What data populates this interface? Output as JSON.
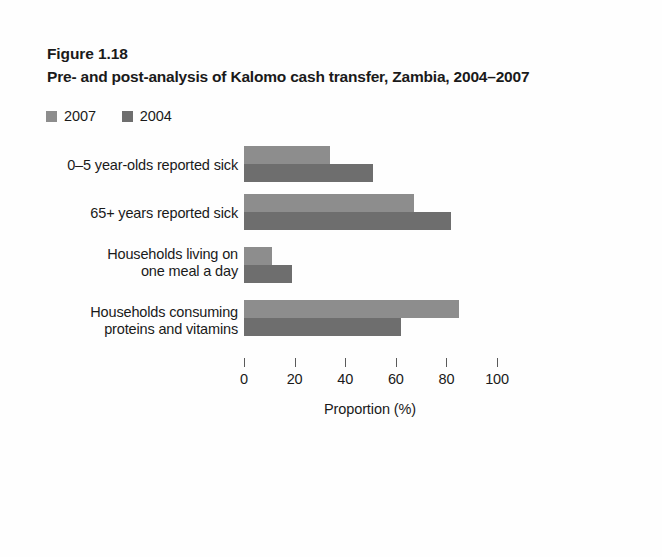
{
  "figure": {
    "number": "Figure 1.18",
    "title": "Pre- and post-analysis of Kalomo cash transfer, Zambia, 2004–2007"
  },
  "colors": {
    "series_2007": "#8d8d8d",
    "series_2004": "#6e6e6e",
    "axis": "#5a5a5a",
    "text": "#1a1a1a",
    "background": "#fefefe"
  },
  "chart_data": {
    "type": "bar",
    "orientation": "horizontal",
    "title": "Pre- and post-analysis of Kalomo cash transfer, Zambia, 2004–2007",
    "xlabel": "Proportion (%)",
    "ylabel": "",
    "xlim": [
      0,
      100
    ],
    "xticks": [
      0,
      20,
      40,
      60,
      80,
      100
    ],
    "xticklabels": [
      "0",
      "20",
      "40",
      "60",
      "80",
      "100"
    ],
    "grid": false,
    "legend_position": "top-left",
    "categories": [
      "0–5 year-olds reported sick",
      "65+ years reported sick",
      "Households living on\none meal a day",
      "Households consuming\nproteins and vitamins"
    ],
    "series": [
      {
        "name": "2007",
        "color": "#8d8d8d",
        "values": [
          34,
          67,
          11,
          85
        ]
      },
      {
        "name": "2004",
        "color": "#6e6e6e",
        "values": [
          51,
          82,
          19,
          62
        ]
      }
    ]
  }
}
